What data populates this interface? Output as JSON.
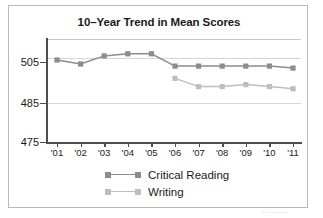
{
  "chart_data": {
    "type": "line",
    "title": "10–Year Trend in Mean Scores",
    "xlabel": "",
    "ylabel": "",
    "categories": [
      "'01",
      "'02",
      "'03",
      "'04",
      "'05",
      "'06",
      "'07",
      "'08",
      "'09",
      "'10",
      "'11"
    ],
    "ytick_labels": [
      "505",
      "485",
      "475"
    ],
    "ytick_values": [
      505,
      485,
      475
    ],
    "ylim": [
      475,
      515
    ],
    "axis_note": "broken / compressed y-axis: spacing between 475 and 485 is not to scale with 485-505",
    "grid": "horizontal gridlines only",
    "legend_position": "below plot, centered",
    "series": [
      {
        "name": "Critical Reading",
        "color": "#8c8c8c",
        "values": [
          506,
          504,
          508,
          509,
          509,
          503,
          503,
          503,
          503,
          503,
          502
        ]
      },
      {
        "name": "Writing",
        "color": "#bdbdbd",
        "values": [
          null,
          null,
          null,
          null,
          null,
          497,
          493,
          493,
          494,
          493,
          492
        ]
      }
    ]
  },
  "footer": {
    "cutoff_text": "·· ··· ·· ··"
  }
}
